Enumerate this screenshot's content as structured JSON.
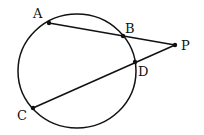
{
  "diagram": {
    "type": "circle-secants",
    "circle": {
      "cx": 77,
      "cy": 71,
      "rx": 59,
      "ry": 57
    },
    "points": {
      "A": {
        "x": 49,
        "y": 23,
        "label": "A",
        "lx": 33,
        "ly": 18
      },
      "B": {
        "x": 123,
        "y": 36,
        "label": "B",
        "lx": 125,
        "ly": 33
      },
      "P": {
        "x": 175,
        "y": 45,
        "label": "P",
        "lx": 181,
        "ly": 50
      },
      "D": {
        "x": 135,
        "y": 62,
        "label": "D",
        "lx": 138,
        "ly": 76
      },
      "C": {
        "x": 33,
        "y": 108,
        "label": "C",
        "lx": 17,
        "ly": 120
      }
    },
    "segments": [
      [
        "A",
        "P"
      ],
      [
        "C",
        "P"
      ]
    ],
    "colors": {
      "stroke": "#111111",
      "background": "#ffffff"
    }
  }
}
